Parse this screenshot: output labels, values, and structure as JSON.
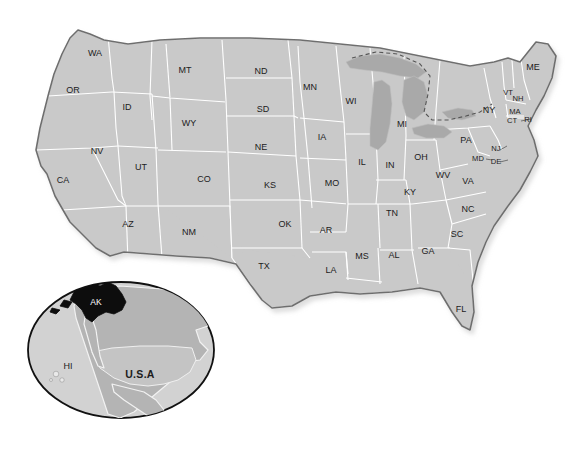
{
  "figure": {
    "background_color": "#ffffff",
    "state_fill_color": "#c9c9c9",
    "state_border_color": "#ffffff",
    "national_outline_color": "#6e6e6e",
    "lake_fill_color": "#a9a9a9",
    "highlight_color": "#0d0d0d"
  },
  "main_map": {
    "name": "contiguous-united-states",
    "state_count": 48,
    "states": [
      {
        "code": "WA",
        "name": "Washington",
        "x": 95,
        "y": 54
      },
      {
        "code": "OR",
        "name": "Oregon",
        "x": 73,
        "y": 91
      },
      {
        "code": "CA",
        "name": "California",
        "x": 63,
        "y": 181
      },
      {
        "code": "NV",
        "name": "Nevada",
        "x": 97,
        "y": 152
      },
      {
        "code": "ID",
        "name": "Idaho",
        "x": 127,
        "y": 108
      },
      {
        "code": "MT",
        "name": "Montana",
        "x": 185,
        "y": 71
      },
      {
        "code": "WY",
        "name": "Wyoming",
        "x": 189,
        "y": 124
      },
      {
        "code": "UT",
        "name": "Utah",
        "x": 141,
        "y": 168
      },
      {
        "code": "AZ",
        "name": "Arizona",
        "x": 128,
        "y": 225
      },
      {
        "code": "NM",
        "name": "New Mexico",
        "x": 189,
        "y": 233
      },
      {
        "code": "CO",
        "name": "Colorado",
        "x": 204,
        "y": 180
      },
      {
        "code": "ND",
        "name": "North Dakota",
        "x": 261,
        "y": 72
      },
      {
        "code": "SD",
        "name": "South Dakota",
        "x": 263,
        "y": 110
      },
      {
        "code": "NE",
        "name": "Nebraska",
        "x": 261,
        "y": 148
      },
      {
        "code": "KS",
        "name": "Kansas",
        "x": 270,
        "y": 186
      },
      {
        "code": "OK",
        "name": "Oklahoma",
        "x": 285,
        "y": 225
      },
      {
        "code": "TX",
        "name": "Texas",
        "x": 264,
        "y": 267
      },
      {
        "code": "MN",
        "name": "Minnesota",
        "x": 310,
        "y": 88
      },
      {
        "code": "IA",
        "name": "Iowa",
        "x": 322,
        "y": 138
      },
      {
        "code": "MO",
        "name": "Missouri",
        "x": 332,
        "y": 184
      },
      {
        "code": "AR",
        "name": "Arkansas",
        "x": 326,
        "y": 231
      },
      {
        "code": "LA",
        "name": "Louisiana",
        "x": 331,
        "y": 271
      },
      {
        "code": "WI",
        "name": "Wisconsin",
        "x": 351,
        "y": 102
      },
      {
        "code": "IL",
        "name": "Illinois",
        "x": 362,
        "y": 163
      },
      {
        "code": "MS",
        "name": "Mississippi",
        "x": 362,
        "y": 257
      },
      {
        "code": "MI",
        "name": "Michigan",
        "x": 402,
        "y": 125
      },
      {
        "code": "IN",
        "name": "Indiana",
        "x": 390,
        "y": 166
      },
      {
        "code": "TN",
        "name": "Tennessee",
        "x": 392,
        "y": 214
      },
      {
        "code": "AL",
        "name": "Alabama",
        "x": 394,
        "y": 256
      },
      {
        "code": "OH",
        "name": "Ohio",
        "x": 421,
        "y": 158
      },
      {
        "code": "KY",
        "name": "Kentucky",
        "x": 410,
        "y": 193
      },
      {
        "code": "GA",
        "name": "Georgia",
        "x": 428,
        "y": 252
      },
      {
        "code": "WV",
        "name": "West Virginia",
        "x": 443,
        "y": 176
      },
      {
        "code": "VA",
        "name": "Virginia",
        "x": 468,
        "y": 182
      },
      {
        "code": "NC",
        "name": "North Carolina",
        "x": 468,
        "y": 210
      },
      {
        "code": "SC",
        "name": "South Carolina",
        "x": 457,
        "y": 235
      },
      {
        "code": "FL",
        "name": "Florida",
        "x": 461,
        "y": 310
      },
      {
        "code": "PA",
        "name": "Pennsylvania",
        "x": 466,
        "y": 141
      },
      {
        "code": "NY",
        "name": "New York",
        "x": 489,
        "y": 111
      },
      {
        "code": "MD",
        "name": "Maryland",
        "x": 478,
        "y": 159
      },
      {
        "code": "DE",
        "name": "Delaware",
        "x": 496,
        "y": 162
      },
      {
        "code": "NJ",
        "name": "New Jersey",
        "x": 496,
        "y": 149
      },
      {
        "code": "VT",
        "name": "Vermont",
        "x": 508,
        "y": 93
      },
      {
        "code": "NH",
        "name": "New Hampshire",
        "x": 517,
        "y": 97
      },
      {
        "code": "MA",
        "name": "Massachusetts",
        "x": 515,
        "y": 112
      },
      {
        "code": "CT",
        "name": "Connecticut",
        "x": 512,
        "y": 121
      },
      {
        "code": "RI",
        "name": "Rhode Island",
        "x": 527,
        "y": 120
      },
      {
        "code": "ME",
        "name": "Maine",
        "x": 533,
        "y": 68
      }
    ],
    "water_features": [
      {
        "name": "Great Lakes",
        "label": ""
      }
    ]
  },
  "inset_map": {
    "name": "north-america-inset",
    "labels": [
      {
        "code": "AK",
        "name": "Alaska",
        "x": 95,
        "y": 303,
        "highlighted": true
      },
      {
        "code": "HI",
        "name": "Hawaii",
        "x": 68,
        "y": 367,
        "highlighted": false
      },
      {
        "code": "U.S.A",
        "name": "United States of America",
        "x": 138,
        "y": 375,
        "highlighted": false
      }
    ]
  }
}
